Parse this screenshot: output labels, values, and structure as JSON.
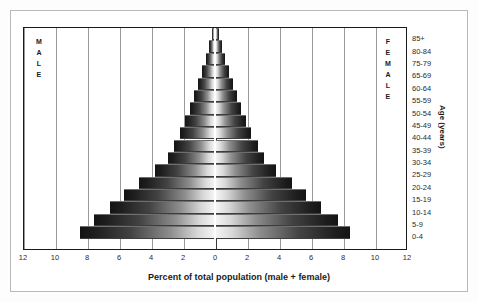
{
  "chart_data": {
    "type": "bar",
    "subtype": "population-pyramid",
    "title": "",
    "xlabel": "Percent of total population (male + female)",
    "ylabel": "Age (years)",
    "xlim": [
      -12,
      12
    ],
    "xticks": [
      12,
      10,
      8,
      6,
      4,
      2,
      0,
      2,
      4,
      6,
      8,
      10,
      12
    ],
    "xtick_step": 2,
    "grid": true,
    "grid_axis": "x",
    "legend": [
      "MALE",
      "FEMALE"
    ],
    "legend_position": "inside-left-and-right",
    "categories": [
      "85+",
      "80-84",
      "75-79",
      "65-69",
      "60-64",
      "55-59",
      "50-54",
      "45-49",
      "40-44",
      "35-39",
      "30-34",
      "25-29",
      "20-24",
      "15-19",
      "10-14",
      "5-9",
      "0-4"
    ],
    "series": [
      {
        "name": "MALE",
        "side": "left",
        "values": [
          0.15,
          0.3,
          0.5,
          0.75,
          1.0,
          1.25,
          1.5,
          1.8,
          2.15,
          2.5,
          2.9,
          3.7,
          4.7,
          5.6,
          6.5,
          7.5,
          8.4
        ]
      },
      {
        "name": "FEMALE",
        "side": "right",
        "values": [
          0.2,
          0.35,
          0.55,
          0.8,
          1.05,
          1.3,
          1.55,
          1.85,
          2.2,
          2.6,
          3.0,
          3.75,
          4.75,
          5.65,
          6.55,
          7.6,
          8.4
        ]
      }
    ]
  },
  "labels": {
    "male_letters": [
      "M",
      "A",
      "L",
      "E"
    ],
    "female_letters": [
      "F",
      "E",
      "M",
      "A",
      "L",
      "E"
    ],
    "age_axis_title": "Age (years)",
    "x_axis_title": "Percent of total population (male + female)"
  }
}
